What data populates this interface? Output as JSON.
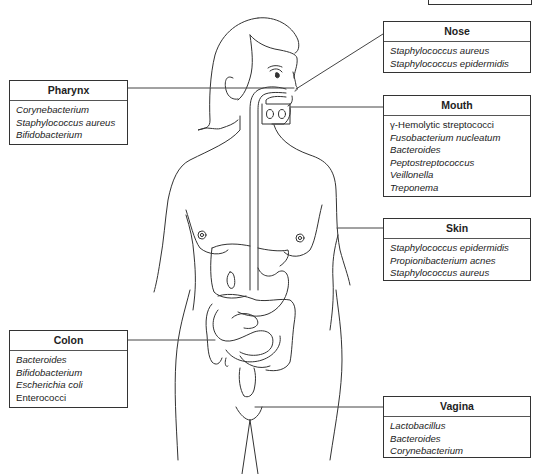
{
  "diagram": {
    "type": "anatomical-labeled-diagram",
    "figure": "Female human body outline with digestive tract"
  },
  "boxes": {
    "nose": {
      "title": "Nose",
      "items": [
        {
          "text": "Staphylococcus aureus",
          "italic": true
        },
        {
          "text": "Staphylococcus epidermidis",
          "italic": true
        }
      ]
    },
    "pharynx": {
      "title": "Pharynx",
      "items": [
        {
          "text": "Corynebacterium",
          "italic": true
        },
        {
          "text": "Staphylococcus aureus",
          "italic": true
        },
        {
          "text": "Bifidobacterium",
          "italic": true
        }
      ]
    },
    "mouth": {
      "title": "Mouth",
      "items": [
        {
          "text": "γ-Hemolytic streptococci",
          "italic": false
        },
        {
          "text": "Fusobacterium nucleatum",
          "italic": true
        },
        {
          "text": "Bacteroides",
          "italic": true
        },
        {
          "text": "Peptostreptococcus",
          "italic": true
        },
        {
          "text": "Veillonella",
          "italic": true
        },
        {
          "text": "Treponema",
          "italic": true
        }
      ]
    },
    "skin": {
      "title": "Skin",
      "items": [
        {
          "text": "Staphylococcus epidermidis",
          "italic": true
        },
        {
          "text": "Propionibacterium acnes",
          "italic": true
        },
        {
          "text": "Staphylococcus aureus",
          "italic": true
        }
      ]
    },
    "colon": {
      "title": "Colon",
      "items": [
        {
          "text": "Bacteroides",
          "italic": true
        },
        {
          "text": "Bifidobacterium",
          "italic": true
        },
        {
          "text": "Escherichia coli",
          "italic": true
        },
        {
          "text": "Enterococci",
          "italic": false
        }
      ]
    },
    "vagina": {
      "title": "Vagina",
      "items": [
        {
          "text": "Lactobacillus",
          "italic": true
        },
        {
          "text": "Bacteroides",
          "italic": true
        },
        {
          "text": "Corynebacterium",
          "italic": true
        }
      ]
    }
  },
  "colors": {
    "line": "#333333",
    "background": "#ffffff"
  }
}
